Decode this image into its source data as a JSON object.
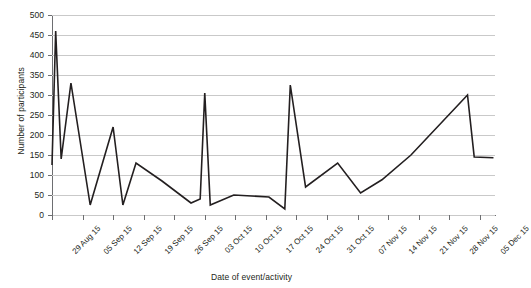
{
  "chart_data": {
    "type": "line",
    "title": "",
    "xlabel": "Date of event/activity",
    "ylabel": "Number of participants",
    "ylim": [
      0,
      500
    ],
    "ytick_step": 50,
    "yticks": [
      0,
      50,
      100,
      150,
      200,
      250,
      300,
      350,
      400,
      450,
      500
    ],
    "ytick_labels": [
      "0",
      "50",
      "100",
      "150",
      "200",
      "250",
      "300",
      "350",
      "400",
      "450",
      "500"
    ],
    "grid": true,
    "grid_axis": "y",
    "legend": false,
    "legend_position": "none",
    "line_color": "#231f20",
    "grid_color": "#c9c9c9",
    "axis_color": "#6d6e71",
    "background": "#ffffff",
    "categories": [
      "29 Aug 15",
      "05 Sep 15",
      "12 Sep 15",
      "19 Sep 15",
      "26 Sep 15",
      "03 Oct 15",
      "10 Oct 15",
      "17 Oct 15",
      "24 Oct 15",
      "31 Oct 15",
      "07 Nov 15",
      "14 Nov 15",
      "21 Nov 15",
      "28 Nov 15",
      "05 Dec 15"
    ],
    "series": [
      {
        "name": "Number of participants",
        "x": [
          0.0,
          0.12,
          0.3,
          0.62,
          1.25,
          2.0,
          2.32,
          2.75,
          3.6,
          4.55,
          4.85,
          5.0,
          5.18,
          5.95,
          7.1,
          7.62,
          7.8,
          8.3,
          9.35,
          10.1,
          10.8,
          11.75,
          13.6,
          13.82,
          14.45
        ],
        "values": [
          125,
          460,
          140,
          330,
          25,
          220,
          25,
          130,
          85,
          30,
          40,
          305,
          25,
          50,
          45,
          15,
          325,
          70,
          130,
          55,
          88,
          150,
          300,
          145,
          143
        ]
      }
    ]
  }
}
